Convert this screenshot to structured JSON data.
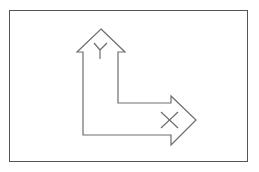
{
  "diagram": {
    "type": "ucs-icon",
    "stroke_color": "#6e6e6e",
    "frame_color": "#555555",
    "background": "#ffffff",
    "axes": [
      {
        "name": "Y",
        "direction": "up"
      },
      {
        "name": "X",
        "direction": "right"
      }
    ]
  }
}
